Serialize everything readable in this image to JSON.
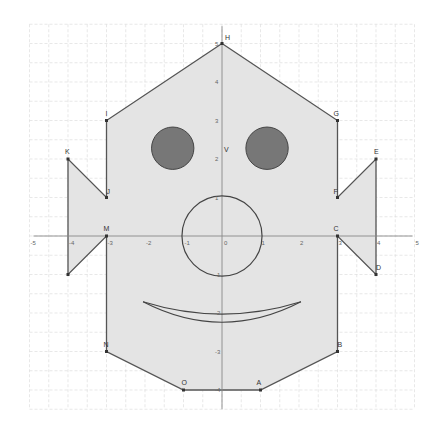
{
  "figure": {
    "type": "coordinate-plane-drawing",
    "origin_px": [
      222,
      236
    ],
    "unit_px": 38.5,
    "grid": {
      "x_range": [
        -5,
        5
      ],
      "y_range": [
        -4.5,
        5.5
      ],
      "minor_step": 0.5,
      "color": "#d8d8d8"
    },
    "x_ticks": [
      "-5",
      "-4",
      "-3",
      "-2",
      "-1",
      "0",
      "1",
      "2",
      "3",
      "4",
      "5"
    ],
    "y_ticks": [
      "5",
      "4",
      "3",
      "2",
      "1",
      "-1",
      "-2",
      "-3",
      "-4"
    ],
    "colors": {
      "fill": "#e4e4e4",
      "stroke": "#555555",
      "eye_fill": "#777777",
      "axis": "#888888"
    },
    "points": [
      {
        "label": "H",
        "x": 0,
        "y": 5
      },
      {
        "label": "G",
        "x": 3,
        "y": 3
      },
      {
        "label": "F",
        "x": 3,
        "y": 1
      },
      {
        "label": "E",
        "x": 4,
        "y": 2
      },
      {
        "label": "D",
        "x": 4,
        "y": -1
      },
      {
        "label": "C",
        "x": 3,
        "y": 0
      },
      {
        "label": "B",
        "x": 3,
        "y": -3
      },
      {
        "label": "A",
        "x": 1,
        "y": -4
      },
      {
        "label": "O",
        "x": -1,
        "y": -4
      },
      {
        "label": "N",
        "x": -3,
        "y": -3
      },
      {
        "label": "M",
        "x": -3,
        "y": 0
      },
      {
        "label": "L",
        "x": -4,
        "y": -1
      },
      {
        "label": "K",
        "x": -4,
        "y": 2
      },
      {
        "label": "J",
        "x": -3,
        "y": 1
      },
      {
        "label": "I",
        "x": -3,
        "y": 3
      },
      {
        "label": "V",
        "x": 0,
        "y": 2.1
      }
    ],
    "eyes": [
      {
        "cx": -1.28,
        "cy": 2.28,
        "r": 0.55
      },
      {
        "cx": 1.17,
        "cy": 2.28,
        "r": 0.55
      }
    ],
    "nose": {
      "cx": 0,
      "cy": 0,
      "r": 1.04
    },
    "mouth": {
      "from": [
        -2.05,
        -1.71
      ],
      "to": [
        2.05,
        -1.71
      ],
      "upper_low": -2.03,
      "lower_low": -2.24
    }
  }
}
